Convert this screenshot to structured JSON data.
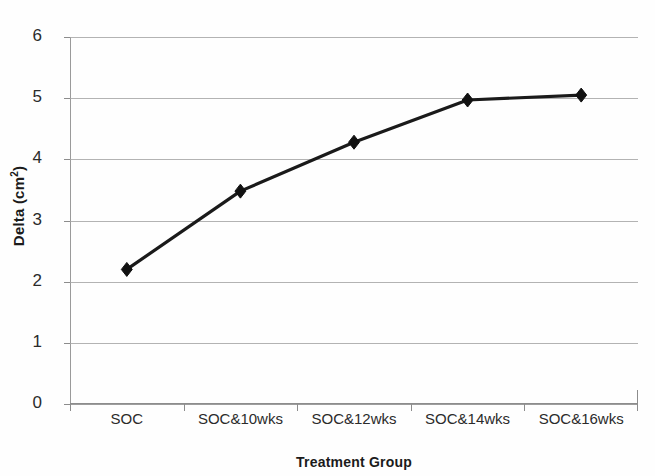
{
  "chart_data": {
    "type": "line",
    "title": "",
    "xlabel": "Treatment Group",
    "ylabel": "Delta (cm2)",
    "ylabel_base": "Delta (cm",
    "ylabel_sup": "2",
    "ylabel_close": ")",
    "categories": [
      "SOC",
      "SOC&10wks",
      "SOC&12wks",
      "SOC&14wks",
      "SOC&16wks"
    ],
    "values": [
      2.2,
      3.48,
      4.28,
      4.97,
      5.05
    ],
    "ylim": [
      0,
      6
    ],
    "yticks": [
      0,
      1,
      2,
      3,
      4,
      5,
      6
    ],
    "ytick_labels": [
      "0",
      "1",
      "2",
      "3",
      "4",
      "5",
      "6"
    ],
    "grid": true,
    "legend": "none",
    "marker": "diamond",
    "line_color": "#1a1a1a",
    "marker_color": "#111111",
    "grid_color": "#a6a6a6",
    "background_color": "#ffffff"
  }
}
